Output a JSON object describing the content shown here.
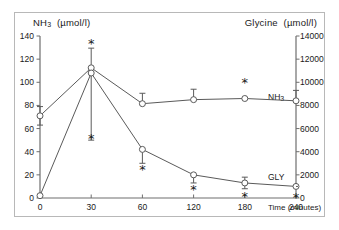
{
  "figure": {
    "left_axis_title_main": "NH",
    "left_axis_title_sub": "3",
    "left_axis_title_unit": "(µmol/l)",
    "right_axis_title": "Glycine",
    "right_axis_title_unit": "(µmol/l)",
    "xaxis_title": "Time (minutes)",
    "series_label_nh3": "NH",
    "series_label_nh3_sub": "3",
    "series_label_gly": "GLY",
    "significance_marker": "*",
    "line_color": "#5a5a5a",
    "marker_color": "#ffffff",
    "axis_color": "#6e6e6e",
    "frame_color": "#b8b8b8"
  },
  "chart_data": {
    "type": "line",
    "title": "",
    "xlabel": "Time (minutes)",
    "x": [
      0,
      30,
      60,
      120,
      180,
      240
    ],
    "xtick_labels": [
      "0",
      "30",
      "60",
      "120",
      "180",
      "240"
    ],
    "grid": false,
    "legend": "inline-right",
    "axes": [
      {
        "id": "left",
        "label": "NH3 (µmol/l)",
        "ylim": [
          0,
          140
        ],
        "yticks": [
          0,
          20,
          40,
          60,
          80,
          100,
          120,
          140
        ],
        "ytick_labels": [
          "0",
          "20",
          "40",
          "60",
          "80",
          "100",
          "120",
          "140"
        ]
      },
      {
        "id": "right",
        "label": "Glycine (µmol/l)",
        "ylim": [
          0,
          14000
        ],
        "yticks": [
          0,
          2000,
          4000,
          6000,
          8000,
          10000,
          12000,
          14000
        ],
        "ytick_labels": [
          "0",
          "2000",
          "4000",
          "6000",
          "8000",
          "10000",
          "12000",
          "14000"
        ]
      }
    ],
    "series": [
      {
        "name": "GLY",
        "axis": "right",
        "unit": "µmol/l",
        "values": [
          7100,
          11250,
          8150,
          8500,
          8600,
          8400
        ],
        "err_up": [
          800,
          1700,
          900,
          900,
          0,
          900
        ],
        "err_down": [
          800,
          0,
          0,
          0,
          0,
          0
        ],
        "significant": [
          false,
          true,
          false,
          false,
          true,
          false
        ],
        "star_position": "above"
      },
      {
        "name": "NH3",
        "axis": "left",
        "unit": "µmol/l",
        "values": [
          2,
          108,
          42,
          20,
          13,
          10
        ],
        "err_up": [
          0,
          0,
          0,
          0,
          5,
          0
        ],
        "err_down": [
          0,
          58,
          12,
          7,
          5,
          0
        ],
        "significant": [
          false,
          true,
          true,
          true,
          true,
          true
        ],
        "star_position": "below"
      }
    ],
    "annotations": [
      {
        "text": "*",
        "x": 30,
        "axis": "right",
        "y": 13400,
        "series": "GLY"
      },
      {
        "text": "*",
        "x": 180,
        "axis": "right",
        "y": 10000,
        "series": "GLY"
      },
      {
        "text": "*",
        "x": 30,
        "axis": "left",
        "y": 52,
        "series": "NH3"
      },
      {
        "text": "*",
        "x": 60,
        "axis": "left",
        "y": 25,
        "series": "NH3"
      },
      {
        "text": "*",
        "x": 120,
        "axis": "left",
        "y": 8,
        "series": "NH3"
      },
      {
        "text": "*",
        "x": 180,
        "axis": "left",
        "y": 2,
        "series": "NH3"
      },
      {
        "text": "*",
        "x": 240,
        "axis": "left",
        "y": 1,
        "series": "NH3"
      }
    ]
  }
}
